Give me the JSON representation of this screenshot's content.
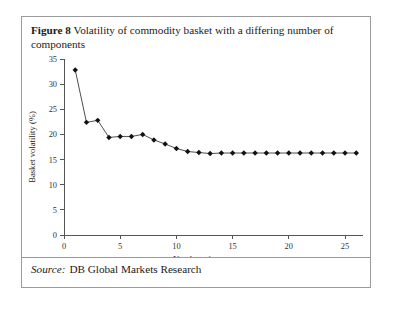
{
  "figure": {
    "label": "Figure 8",
    "caption": "Volatility of commodity basket with a differing number of components"
  },
  "source": {
    "label": "Source:",
    "value": "DB Global Markets Research"
  },
  "chart_data": {
    "type": "line",
    "title": "Volatility of commodity basket with a differing number of components",
    "xlabel": "Number of components",
    "ylabel": "Basket volatility (%)",
    "xlim": [
      0,
      26.6
    ],
    "ylim": [
      0,
      35
    ],
    "xticks": [
      0,
      5,
      10,
      15,
      20,
      25
    ],
    "yticks": [
      0,
      5,
      10,
      15,
      20,
      25,
      30,
      35
    ],
    "grid": false,
    "legend": false,
    "marker": "diamond",
    "x": [
      1,
      2,
      3,
      4,
      5,
      6,
      7,
      8,
      9,
      10,
      11,
      12,
      13,
      14,
      15,
      16,
      17,
      18,
      19,
      20,
      21,
      22,
      23,
      24,
      25,
      26
    ],
    "y": [
      32.8,
      22.4,
      22.8,
      19.4,
      19.6,
      19.6,
      20.0,
      18.9,
      18.1,
      17.2,
      16.6,
      16.4,
      16.2,
      16.3,
      16.3,
      16.3,
      16.3,
      16.3,
      16.3,
      16.3,
      16.3,
      16.3,
      16.3,
      16.3,
      16.3,
      16.3
    ],
    "series": [
      {
        "name": "Basket volatility",
        "values": [
          32.8,
          22.4,
          22.8,
          19.4,
          19.6,
          19.6,
          20.0,
          18.9,
          18.1,
          17.2,
          16.6,
          16.4,
          16.2,
          16.3,
          16.3,
          16.3,
          16.3,
          16.3,
          16.3,
          16.3,
          16.3,
          16.3,
          16.3,
          16.3,
          16.3,
          16.3
        ]
      }
    ],
    "colors": {
      "line": "#3a3a3a",
      "marker": "#111111",
      "axis": "#555555",
      "text": "#333333"
    }
  }
}
